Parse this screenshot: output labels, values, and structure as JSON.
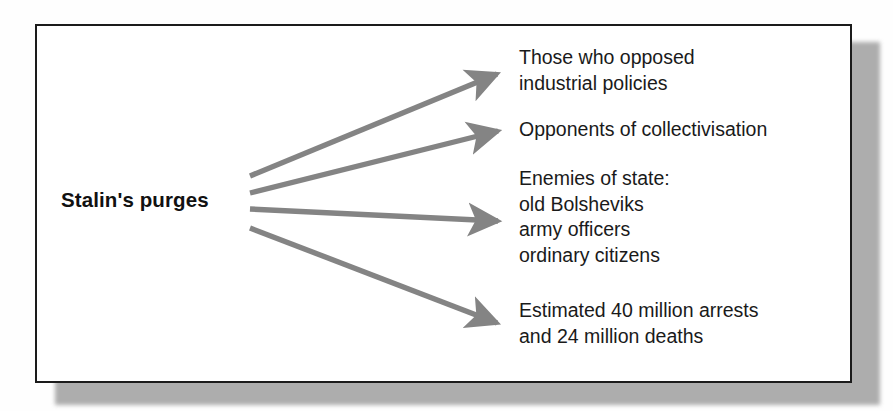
{
  "diagram": {
    "type": "fan-out-spider-diagram",
    "source": {
      "label": "Stalin's purges"
    },
    "branches": [
      {
        "id": "opposed-industrial-policies",
        "lines": [
          "Those who opposed",
          "industrial policies"
        ],
        "arrow": {
          "x1": 250,
          "y1": 176,
          "x2": 507,
          "y2": 71
        }
      },
      {
        "id": "opponents-of-collectivisation",
        "lines": [
          "Opponents of collectivisation"
        ],
        "arrow": {
          "x1": 250,
          "y1": 193,
          "x2": 508,
          "y2": 129
        }
      },
      {
        "id": "enemies-of-state",
        "lines": [
          "Enemies of state:",
          "old Bolsheviks",
          "army officers",
          "ordinary citizens"
        ],
        "arrow": {
          "x1": 250,
          "y1": 209,
          "x2": 508,
          "y2": 221
        }
      },
      {
        "id": "estimated-arrests-and-deaths",
        "lines": [
          "Estimated 40 million arrests",
          "and 24 million deaths"
        ],
        "arrow": {
          "x1": 250,
          "y1": 228,
          "x2": 508,
          "y2": 327
        }
      }
    ],
    "colors": {
      "arrow": "#848484",
      "border": "#1b1b1b",
      "text": "#1a1a1a",
      "panel_background": "#ffffff",
      "shadow": "#8e8e8e"
    }
  }
}
